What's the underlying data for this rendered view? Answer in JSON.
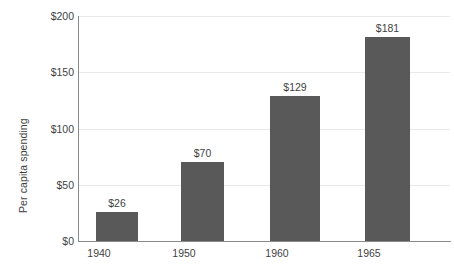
{
  "chart_data": {
    "type": "bar",
    "title": "",
    "xlabel": "",
    "ylabel": "Per capita spending",
    "categories": [
      "1940",
      "1950",
      "1960",
      "1965"
    ],
    "values": [
      26,
      70,
      129,
      181
    ],
    "data_labels": [
      "$26",
      "$70",
      "$129",
      "$181"
    ],
    "ylim": [
      0,
      200
    ],
    "yticks": [
      0,
      50,
      100,
      150,
      200
    ],
    "ytick_labels": [
      "$0",
      "$50",
      "$100",
      "$150",
      "$200"
    ],
    "grid": true,
    "legend": false,
    "series": [
      {
        "name": "Per capita spending",
        "values": [
          26,
          70,
          129,
          181
        ],
        "color": "#595959"
      }
    ]
  },
  "style": {
    "bar_color": "#595959",
    "gridline_color": "#e9e9e9",
    "axis_color": "#8a8a8a",
    "text_color": "#3f3f3f",
    "background": "#ffffff"
  }
}
